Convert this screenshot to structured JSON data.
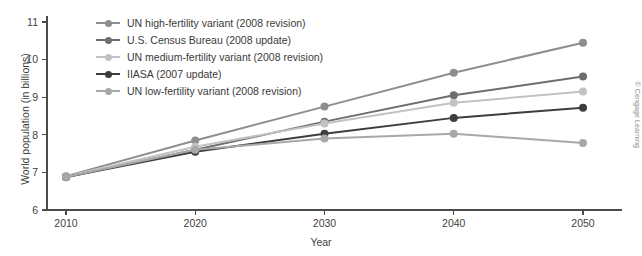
{
  "chart_data": {
    "type": "line",
    "title": "",
    "xlabel": "Year",
    "ylabel": "World population (in billions)",
    "x": [
      2010,
      2020,
      2030,
      2040,
      2050
    ],
    "xticklabels": [
      "2010",
      "2020",
      "2030",
      "2040",
      "2050"
    ],
    "yticklabels": [
      "6",
      "7",
      "8",
      "9",
      "10",
      "11"
    ],
    "ylim": [
      6,
      11
    ],
    "xlim": [
      2008,
      2052
    ],
    "grid": false,
    "legend_position": "top-left inside",
    "series": [
      {
        "name": "UN high-fertility variant (2008 revision)",
        "color": "#8e8e8e",
        "values": [
          6.9,
          7.85,
          8.75,
          9.65,
          10.45
        ]
      },
      {
        "name": "U.S. Census Bureau (2008 update)",
        "color": "#6e6e6e",
        "values": [
          6.87,
          7.6,
          8.35,
          9.05,
          9.55
        ]
      },
      {
        "name": "UN medium-fertility variant (2008 revision)",
        "color": "#c2c2c2",
        "values": [
          6.9,
          7.68,
          8.3,
          8.85,
          9.15
        ]
      },
      {
        "name": "IIASA (2007 update)",
        "color": "#3d3d3d",
        "values": [
          6.88,
          7.55,
          8.03,
          8.45,
          8.72
        ]
      },
      {
        "name": "UN low-fertility variant (2008 revision)",
        "color": "#a8a8a8",
        "values": [
          6.88,
          7.6,
          7.9,
          8.03,
          7.78
        ]
      }
    ],
    "annotations": {
      "copyright": "© Cengage Learning"
    }
  },
  "axis": {
    "y_title": "World population (in billions)",
    "x_title": "Year"
  },
  "credit": {
    "text": "© Cengage Learning"
  },
  "colors": {
    "axis": "#4a4a4a",
    "text": "#3a3a3a",
    "background": "#ffffff"
  }
}
